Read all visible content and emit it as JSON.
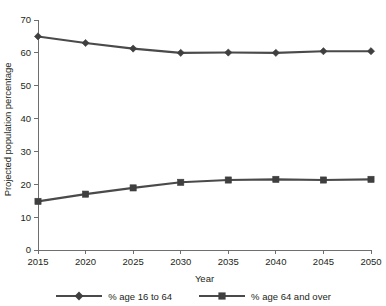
{
  "chart_data": {
    "type": "line",
    "title": "",
    "xlabel": "Year",
    "ylabel": "Projected population percentage",
    "x": [
      2015,
      2020,
      2025,
      2030,
      2035,
      2040,
      2045,
      2050
    ],
    "xtick_labels": [
      "2015",
      "2020",
      "2025",
      "2030",
      "2035",
      "2040",
      "2045",
      "2050"
    ],
    "ytick_labels": [
      "0",
      "10",
      "20",
      "30",
      "40",
      "50",
      "60",
      "70"
    ],
    "yticks": [
      0,
      10,
      20,
      30,
      40,
      50,
      60,
      70
    ],
    "xlim": [
      2015,
      2050
    ],
    "ylim": [
      0,
      70
    ],
    "grid": false,
    "legend_position": "bottom",
    "series": [
      {
        "name": "% age 16 to 64",
        "marker": "diamond",
        "color": "#4a4a4a",
        "values": [
          65.0,
          63.0,
          61.3,
          60.0,
          60.1,
          60.0,
          60.5,
          60.5
        ]
      },
      {
        "name": "% age 64 and over",
        "marker": "square",
        "color": "#4a4a4a",
        "values": [
          14.8,
          17.0,
          18.9,
          20.6,
          21.3,
          21.5,
          21.3,
          21.5
        ]
      }
    ]
  },
  "legend": {
    "entries": [
      {
        "label": "% age 16 to 64",
        "marker": "diamond"
      },
      {
        "label": "% age 64 and over",
        "marker": "square"
      }
    ]
  },
  "colors": {
    "line": "#4a4a4a",
    "marker": "#3f3f3f",
    "axis": "#6d6e71",
    "text": "#231f20",
    "background": "#ffffff"
  }
}
